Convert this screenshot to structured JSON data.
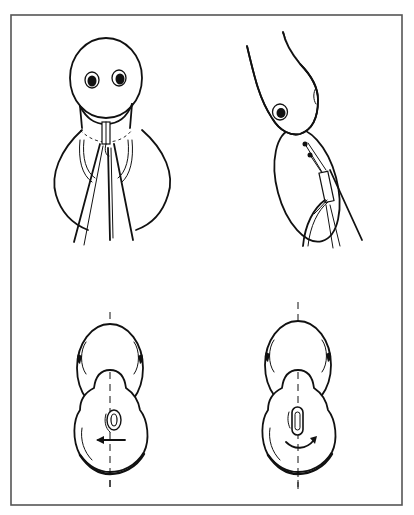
{
  "figure": {
    "panels": [
      {
        "id": "top-left",
        "view": "front view with forceps/instrument inserted at neck"
      },
      {
        "id": "top-right",
        "view": "tilted side view with probe/wire instrument"
      },
      {
        "id": "bottom-left",
        "view": "top-down view with leftward arrow, dashed center axis"
      },
      {
        "id": "bottom-right",
        "view": "top-down view with curved rotation arrow, dashed center axis"
      }
    ],
    "colors": {
      "ink": "#111111",
      "frame": "#555555",
      "background": "#ffffff"
    }
  }
}
